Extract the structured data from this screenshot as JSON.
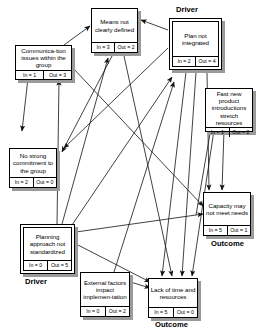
{
  "diagram": {
    "type": "influence-diagram",
    "nodes": [
      {
        "id": "means",
        "label": "Means not clearly defined",
        "in_label": "In = 3",
        "out_label": "Out = 2",
        "in": 3,
        "out": 2,
        "role": "",
        "style": "single"
      },
      {
        "id": "plan",
        "label": "Plan not integrated",
        "in_label": "In = 2",
        "out_label": "Out = 4",
        "in": 2,
        "out": 4,
        "role": "Driver",
        "style": "double"
      },
      {
        "id": "comm",
        "label": "Communica-tion issues within the group",
        "in_label": "In = 1",
        "out_label": "Out = 3",
        "in": 1,
        "out": 3,
        "role": "",
        "style": "single"
      },
      {
        "id": "fast",
        "label": "Fast new product introductions stretch resources",
        "in_label": "In = 1",
        "out_label": "Out = 2",
        "in": 1,
        "out": 2,
        "role": "",
        "style": "single"
      },
      {
        "id": "nostrong",
        "label": "No strong commitment to the group",
        "in_label": "In = 2",
        "out_label": "Out = 0",
        "in": 2,
        "out": 0,
        "role": "",
        "style": "single"
      },
      {
        "id": "capacity",
        "label": "Capacity may not meet needs",
        "in_label": "In = 5",
        "out_label": "Out = 1",
        "in": 5,
        "out": 1,
        "role": "Outcome",
        "style": "single"
      },
      {
        "id": "planning",
        "label": "Planning approach not standardized",
        "in_label": "In = 0",
        "out_label": "Out = 5",
        "in": 0,
        "out": 5,
        "role": "Driver",
        "style": "double"
      },
      {
        "id": "external",
        "label": "External factors impact implemen-tation",
        "in_label": "In = 0",
        "out_label": "Out = 2",
        "in": 0,
        "out": 2,
        "role": "",
        "style": "single"
      },
      {
        "id": "lack",
        "label": "Lack of time and resources",
        "in_label": "In = 5",
        "out_label": "Out = 0",
        "in": 5,
        "out": 0,
        "role": "Outcome",
        "style": "single"
      }
    ],
    "role_labels": {
      "driver": "Driver",
      "outcome": "Outcome"
    },
    "edges": [
      {
        "from": "comm",
        "to": "means"
      },
      {
        "from": "comm",
        "to": "nostrong"
      },
      {
        "from": "comm",
        "to": "capacity"
      },
      {
        "from": "plan",
        "to": "means"
      },
      {
        "from": "plan",
        "to": "lack"
      },
      {
        "from": "plan",
        "to": "capacity"
      },
      {
        "from": "plan",
        "to": "lack"
      },
      {
        "from": "means",
        "to": "nostrong"
      },
      {
        "from": "means",
        "to": "lack"
      },
      {
        "from": "planning",
        "to": "means"
      },
      {
        "from": "planning",
        "to": "comm"
      },
      {
        "from": "planning",
        "to": "plan"
      },
      {
        "from": "planning",
        "to": "capacity"
      },
      {
        "from": "planning",
        "to": "lack"
      },
      {
        "from": "external",
        "to": "plan"
      },
      {
        "from": "external",
        "to": "lack"
      },
      {
        "from": "fast",
        "to": "capacity"
      },
      {
        "from": "fast",
        "to": "lack"
      },
      {
        "from": "capacity",
        "to": "fast"
      }
    ],
    "colors": {
      "line": "#1a1a1a",
      "box_fill": "#ffffff",
      "box_border": "#000000",
      "shadow": "#9a9a9a",
      "background": "#ffffff"
    }
  }
}
